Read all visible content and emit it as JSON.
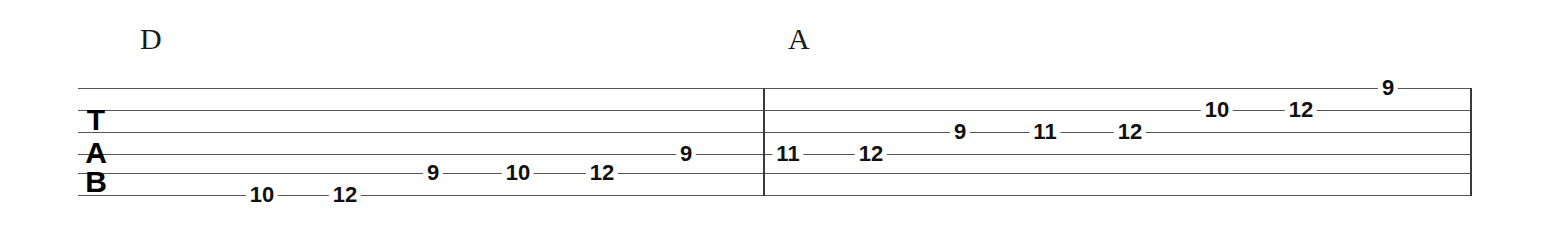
{
  "document": {
    "type": "guitar-tablature",
    "staff": {
      "left_x": 78,
      "right_x": 1470,
      "line_color": "#555555",
      "string_line_y": [
        88,
        110,
        132,
        154,
        173,
        195
      ],
      "string_count": 6
    },
    "clef": {
      "letters": [
        "T",
        "A",
        "B"
      ],
      "letter_y": [
        120,
        153,
        182
      ],
      "x": 96
    },
    "bar_lines": [
      {
        "name": "measure-divider",
        "x": 763
      },
      {
        "name": "end-barline",
        "x": 1470
      }
    ]
  },
  "chords": [
    {
      "label": "D",
      "x": 140,
      "y": 24
    },
    {
      "label": "A",
      "x": 788,
      "y": 24
    }
  ],
  "chart_data": {
    "type": "table",
    "tuning_labels": [
      "T",
      "A",
      "B"
    ],
    "string_count": 6,
    "measures": [
      {
        "index": 1,
        "chord": "D",
        "notes": [
          {
            "fret": "10",
            "string": 6,
            "x": 262,
            "y": 195
          },
          {
            "fret": "12",
            "string": 6,
            "x": 345,
            "y": 195
          },
          {
            "fret": "9",
            "string": 5,
            "x": 433,
            "y": 173
          },
          {
            "fret": "10",
            "string": 5,
            "x": 518,
            "y": 173
          },
          {
            "fret": "12",
            "string": 5,
            "x": 602,
            "y": 173
          },
          {
            "fret": "9",
            "string": 4,
            "x": 686,
            "y": 154
          }
        ]
      },
      {
        "index": 2,
        "chord": "A",
        "notes": [
          {
            "fret": "11",
            "string": 4,
            "x": 788,
            "y": 154
          },
          {
            "fret": "12",
            "string": 4,
            "x": 871,
            "y": 154
          },
          {
            "fret": "9",
            "string": 3,
            "x": 960,
            "y": 132
          },
          {
            "fret": "11",
            "string": 3,
            "x": 1045,
            "y": 132
          },
          {
            "fret": "12",
            "string": 3,
            "x": 1130,
            "y": 132
          },
          {
            "fret": "10",
            "string": 2,
            "x": 1217,
            "y": 110
          },
          {
            "fret": "12",
            "string": 2,
            "x": 1301,
            "y": 110
          },
          {
            "fret": "9",
            "string": 1,
            "x": 1388,
            "y": 88
          }
        ]
      }
    ]
  }
}
